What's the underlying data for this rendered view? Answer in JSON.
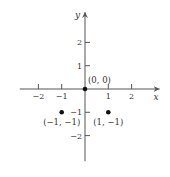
{
  "chart_data": {
    "type": "scatter",
    "title": "",
    "xlabel": "x",
    "ylabel": "y",
    "xlim": [
      -2.8,
      3.2
    ],
    "ylim": [
      -3.1,
      3.3
    ],
    "grid": false,
    "x_ticks": [
      -2,
      -1,
      1,
      2
    ],
    "y_ticks": [
      -2,
      -1,
      1,
      2
    ],
    "x_tick_labels": [
      "−2",
      "−1",
      "1",
      "2"
    ],
    "y_tick_labels": [
      "−2",
      "−1",
      "1",
      "2"
    ],
    "points": [
      {
        "x": 0,
        "y": 0,
        "label": "(0, 0)"
      },
      {
        "x": -1,
        "y": -1,
        "label": "(−1, −1)"
      },
      {
        "x": 1,
        "y": -1,
        "label": "(1, −1)"
      }
    ]
  }
}
